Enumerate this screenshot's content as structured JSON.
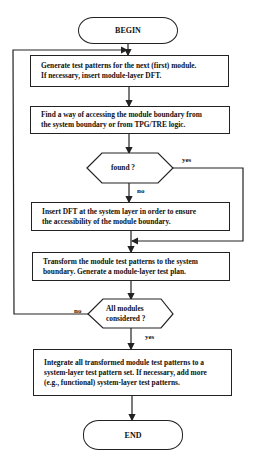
{
  "flowchart": {
    "begin": "BEGIN",
    "end": "END",
    "steps": [
      {
        "id": "step1",
        "lines": [
          "Generate test patterns for the next (first) module.",
          "If necessary, insert module-layer DFT."
        ]
      },
      {
        "id": "step2",
        "lines": [
          "Find a way of accessing the module boundary from",
          "the system boundary or from TPG/TRE logic."
        ]
      },
      {
        "id": "step3",
        "lines": [
          "Insert DFT at the system layer in order to ensure",
          "the accessibility of the module boundary."
        ]
      },
      {
        "id": "step4",
        "lines": [
          "Transform the module test patterns to the system",
          "boundary. Generate a module-layer test plan."
        ]
      },
      {
        "id": "step5",
        "lines": [
          "Integrate all transformed module test patterns to a",
          "system-layer test pattern set. If necessary, add more",
          "(e.g., functional) system-layer test patterns."
        ]
      }
    ],
    "decisions": [
      {
        "id": "found",
        "lines": [
          "found ?"
        ],
        "yes_label": "yes",
        "no_label": "no"
      },
      {
        "id": "all_modules",
        "lines": [
          "All modules",
          "considered ?"
        ],
        "yes_label": "yes",
        "no_label": "no"
      }
    ],
    "colors": {
      "stroke": "#222222",
      "background": "#ffffff",
      "text": "#111111"
    }
  }
}
